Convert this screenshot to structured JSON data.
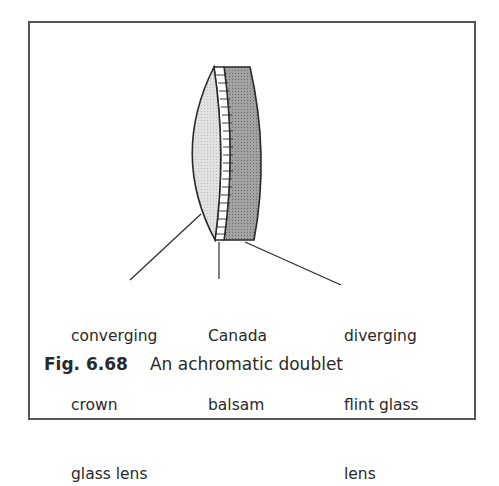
{
  "figure": {
    "number": "Fig. 6.68",
    "title": "An achromatic doublet"
  },
  "labels": {
    "crown": {
      "line1": "converging",
      "line2": "crown",
      "line3": "glass lens"
    },
    "balsam": {
      "line1": "Canada",
      "line2": "balsam"
    },
    "flint": {
      "line1": "diverging",
      "line2": "flint glass",
      "line3": "lens"
    }
  },
  "colors": {
    "crown_fill": "#dcdcdc",
    "flint_fill": "#9a9a9a",
    "balsam_fill": "#ffffff",
    "outline": "#2a2a2a"
  }
}
